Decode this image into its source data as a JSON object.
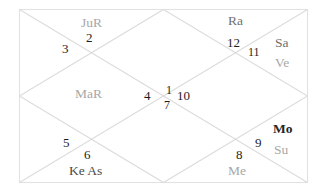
{
  "chart": {
    "kind": "north-indian-vedic-birth-chart",
    "title": "",
    "background_color": "#ffffff",
    "line_color": "#dcdcdc",
    "border_color": "#e2e2e2",
    "frame": {
      "x": 19,
      "y": 9,
      "width": 289,
      "height": 174
    },
    "house_number_color": "#1d1d1d",
    "planet_label_color": "#a8a8a8",
    "houses": [
      {
        "number": "1",
        "x": 166,
        "y": 84,
        "size": "sm"
      },
      {
        "number": "2",
        "x": 86,
        "y": 31,
        "size": "md"
      },
      {
        "number": "3",
        "x": 62,
        "y": 42,
        "size": "md"
      },
      {
        "number": "4",
        "x": 144,
        "y": 89,
        "size": "md"
      },
      {
        "number": "5",
        "x": 63,
        "y": 136,
        "size": "md"
      },
      {
        "number": "6",
        "x": 84,
        "y": 148,
        "size": "md"
      },
      {
        "number": "7",
        "x": 164,
        "y": 99,
        "size": "sm"
      },
      {
        "number": "8",
        "x": 236,
        "y": 148,
        "size": "md"
      },
      {
        "number": "9",
        "x": 255,
        "y": 136,
        "size": "md"
      },
      {
        "number": "10",
        "x": 177,
        "y": 89,
        "size": "md"
      },
      {
        "number": "11",
        "x": 248,
        "y": 46,
        "size": "sm"
      },
      {
        "number": "12",
        "x": 227,
        "y": 36,
        "size": "md"
      }
    ],
    "planets": [
      {
        "label": "JuR",
        "x": 81,
        "y": 16,
        "tone": "normal",
        "title": "jupiter-retrograde"
      },
      {
        "label": "Ra",
        "x": 228,
        "y": 14,
        "tone": "dark",
        "title": "rahu"
      },
      {
        "label": "Sa",
        "x": 275,
        "y": 36,
        "tone": "dark",
        "title": "saturn"
      },
      {
        "label": "Ve",
        "x": 275,
        "y": 56,
        "tone": "normal",
        "title": "venus"
      },
      {
        "label": "MaR",
        "x": 75,
        "y": 87,
        "tone": "normal",
        "title": "mars-retrograde"
      },
      {
        "label": "Mo",
        "x": 273,
        "y": 122,
        "tone": "bold",
        "title": "moon"
      },
      {
        "label": "Su",
        "x": 274,
        "y": 143,
        "tone": "normal",
        "title": "sun"
      },
      {
        "label": "Ke As",
        "x": 69,
        "y": 164,
        "tone": "darker",
        "title": "ketu-ascendant"
      },
      {
        "label": "Me",
        "x": 228,
        "y": 164,
        "tone": "normal",
        "title": "mercury"
      }
    ]
  }
}
